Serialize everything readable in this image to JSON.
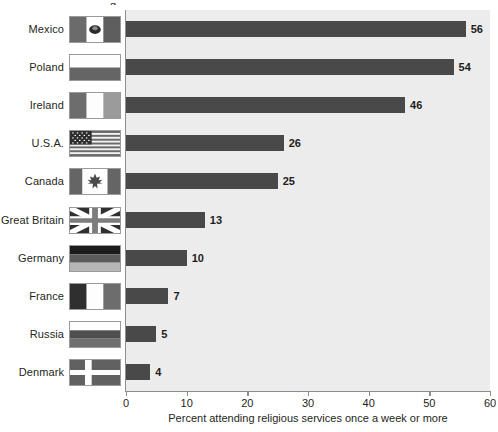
{
  "title_fragment": "g",
  "chart_data": {
    "type": "bar",
    "orientation": "horizontal",
    "title": "",
    "xlabel": "Percent attending religious services once a week or more",
    "ylabel": "",
    "xlim": [
      0,
      60
    ],
    "xticks": [
      0,
      10,
      20,
      30,
      40,
      50,
      60
    ],
    "xtick_labels": [
      "0",
      "10",
      "20",
      "30",
      "40",
      "50",
      "60"
    ],
    "grid": false,
    "legend": "none",
    "categories": [
      "Mexico",
      "Poland",
      "Ireland",
      "U.S.A.",
      "Canada",
      "Great Britain",
      "Germany",
      "France",
      "Russia",
      "Denmark"
    ],
    "values": [
      56,
      54,
      46,
      26,
      25,
      13,
      10,
      7,
      5,
      4
    ],
    "value_labels": [
      "56",
      "54",
      "46",
      "26",
      "25",
      "13",
      "10",
      "7",
      "5",
      "4"
    ],
    "bar_color": "#494949",
    "plot_background": "#ececec",
    "axis_color": "#8d8d8d",
    "text_color": "#231f20"
  },
  "rows": [
    {
      "label": "Mexico",
      "value": 56,
      "value_label": "56",
      "flag": "flag-mexico-icon"
    },
    {
      "label": "Poland",
      "value": 54,
      "value_label": "54",
      "flag": "flag-poland-icon"
    },
    {
      "label": "Ireland",
      "value": 46,
      "value_label": "46",
      "flag": "flag-ireland-icon"
    },
    {
      "label": "U.S.A.",
      "value": 26,
      "value_label": "26",
      "flag": "flag-usa-icon"
    },
    {
      "label": "Canada",
      "value": 25,
      "value_label": "25",
      "flag": "flag-canada-icon"
    },
    {
      "label": "Great Britain",
      "value": 13,
      "value_label": "13",
      "flag": "flag-great-britain-icon"
    },
    {
      "label": "Germany",
      "value": 10,
      "value_label": "10",
      "flag": "flag-germany-icon"
    },
    {
      "label": "France",
      "value": 7,
      "value_label": "7",
      "flag": "flag-france-icon"
    },
    {
      "label": "Russia",
      "value": 5,
      "value_label": "5",
      "flag": "flag-russia-icon"
    },
    {
      "label": "Denmark",
      "value": 4,
      "value_label": "4",
      "flag": "flag-denmark-icon"
    }
  ],
  "axis": {
    "ticks": [
      "0",
      "10",
      "20",
      "30",
      "40",
      "50",
      "60"
    ],
    "title": "Percent attending religious services once a week or more"
  }
}
